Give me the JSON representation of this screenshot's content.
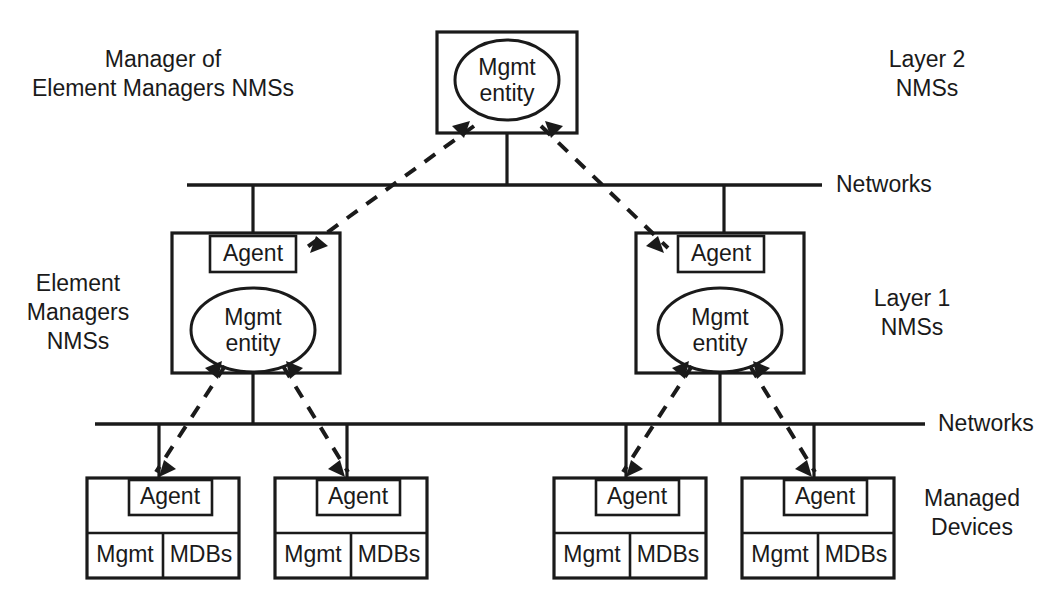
{
  "diagram": {
    "colors": {
      "background": "#ffffff",
      "stroke": "#1a1a1a",
      "fill": "#ffffff"
    },
    "labels": {
      "top_left": {
        "line1": "Manager of",
        "line2": "Element Managers NMSs"
      },
      "top_right": {
        "line1": "Layer 2",
        "line2": "NMSs"
      },
      "mid_left": {
        "line1": "Element",
        "line2": "Managers",
        "line3": "NMSs"
      },
      "mid_right": {
        "line1": "Layer 1",
        "line2": "NMSs"
      },
      "bottom_right": {
        "line1": "Managed",
        "line2": "Devices"
      },
      "network_upper": "Networks",
      "network_lower": "Networks"
    },
    "nodes": {
      "layer2_manager": {
        "entity_line1": "Mgmt",
        "entity_line2": "entity"
      },
      "layer1_left": {
        "agent": "Agent",
        "entity_line1": "Mgmt",
        "entity_line2": "entity"
      },
      "layer1_right": {
        "agent": "Agent",
        "entity_line1": "Mgmt",
        "entity_line2": "entity"
      },
      "device_1": {
        "agent": "Agent",
        "mgmt": "Mgmt",
        "mdbs": "MDBs"
      },
      "device_2": {
        "agent": "Agent",
        "mgmt": "Mgmt",
        "mdbs": "MDBs"
      },
      "device_3": {
        "agent": "Agent",
        "mgmt": "Mgmt",
        "mdbs": "MDBs"
      },
      "device_4": {
        "agent": "Agent",
        "mgmt": "Mgmt",
        "mdbs": "MDBs"
      }
    }
  }
}
